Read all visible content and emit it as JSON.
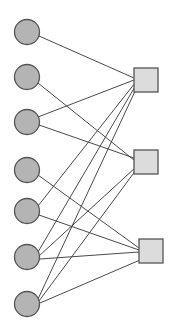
{
  "diagram": {
    "type": "bipartite-graph",
    "canvas": {
      "width": 173,
      "height": 333,
      "background": "#ffffff"
    },
    "style": {
      "circle_fill": "#b4b4b4",
      "circle_stroke": "#555555",
      "square_fill": "#dcdcdc",
      "square_stroke": "#555555",
      "edge_stroke": "#4a4a4a",
      "edge_width": 1
    },
    "left_nodes": [
      {
        "id": "c1",
        "shape": "circle",
        "cx": 27,
        "cy": 32,
        "r": 12.5
      },
      {
        "id": "c2",
        "shape": "circle",
        "cx": 27,
        "cy": 77,
        "r": 12.5
      },
      {
        "id": "c3",
        "shape": "circle",
        "cx": 27,
        "cy": 122,
        "r": 12.5
      },
      {
        "id": "c4",
        "shape": "circle",
        "cx": 27,
        "cy": 170,
        "r": 12.5
      },
      {
        "id": "c5",
        "shape": "circle",
        "cx": 27,
        "cy": 211,
        "r": 12.5
      },
      {
        "id": "c6",
        "shape": "circle",
        "cx": 27,
        "cy": 257,
        "r": 12.5
      },
      {
        "id": "c7",
        "shape": "circle",
        "cx": 27,
        "cy": 304,
        "r": 12.5
      }
    ],
    "right_nodes": [
      {
        "id": "s1",
        "shape": "square",
        "x": 134,
        "y": 68,
        "size": 24
      },
      {
        "id": "s2",
        "shape": "square",
        "x": 134,
        "y": 150,
        "size": 24
      },
      {
        "id": "s3",
        "shape": "square",
        "x": 139,
        "y": 239,
        "size": 24
      }
    ],
    "edges": [
      {
        "from": "c1",
        "to": "s1",
        "x1": 39,
        "y1": 36,
        "x2": 134,
        "y2": 78
      },
      {
        "from": "c2",
        "to": "s2",
        "x1": 38,
        "y1": 83,
        "x2": 134,
        "y2": 160
      },
      {
        "from": "c3",
        "to": "s1",
        "x1": 38,
        "y1": 117,
        "x2": 134,
        "y2": 80
      },
      {
        "from": "c3",
        "to": "s2",
        "x1": 39,
        "y1": 125,
        "x2": 134,
        "y2": 158
      },
      {
        "from": "c4",
        "to": "s3",
        "x1": 38,
        "y1": 175,
        "x2": 139,
        "y2": 248
      },
      {
        "from": "c5",
        "to": "s1",
        "x1": 38,
        "y1": 206,
        "x2": 135,
        "y2": 83
      },
      {
        "from": "c5",
        "to": "s3",
        "x1": 39,
        "y1": 215,
        "x2": 139,
        "y2": 250
      },
      {
        "from": "c6",
        "to": "s1",
        "x1": 38,
        "y1": 252,
        "x2": 136,
        "y2": 85
      },
      {
        "from": "c6",
        "to": "s2",
        "x1": 39,
        "y1": 256,
        "x2": 135,
        "y2": 168
      },
      {
        "from": "c6",
        "to": "s3",
        "x1": 40,
        "y1": 259,
        "x2": 139,
        "y2": 252
      },
      {
        "from": "c7",
        "to": "s1",
        "x1": 38,
        "y1": 299,
        "x2": 137,
        "y2": 87
      },
      {
        "from": "c7",
        "to": "s2",
        "x1": 39,
        "y1": 301,
        "x2": 136,
        "y2": 170
      },
      {
        "from": "c7",
        "to": "s3",
        "x1": 40,
        "y1": 303,
        "x2": 140,
        "y2": 260
      }
    ],
    "counts": {
      "left_nodes": 7,
      "right_nodes": 3,
      "edges": 13
    }
  }
}
